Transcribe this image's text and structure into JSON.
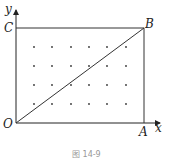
{
  "figure": {
    "caption": "图 14-9",
    "labels": {
      "y_axis": "y",
      "x_axis": "x",
      "origin": "O",
      "A": "A",
      "B": "B",
      "C": "C"
    },
    "rectangle": [
      "O",
      "A",
      "B",
      "C"
    ],
    "diagonal": [
      "O",
      "B"
    ],
    "dot_grid": {
      "columns": 6,
      "rows": 4
    }
  }
}
